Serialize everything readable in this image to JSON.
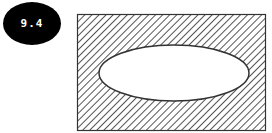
{
  "badge": {
    "label": "9.4"
  },
  "diagram": {
    "type": "venn",
    "colors": {
      "stroke": "#333333",
      "hatch": "#555555",
      "fill": "#ffffff"
    }
  }
}
